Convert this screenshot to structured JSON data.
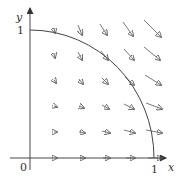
{
  "figure": {
    "axis_labels": {
      "x": "x",
      "y": "y"
    },
    "tick_labels": {
      "origin": "0",
      "x_one": "1",
      "y_one": "1"
    },
    "colors": {
      "axis": "#333333",
      "arrow": "#555555",
      "curve": "#444444",
      "background": "#ffffff"
    }
  }
}
